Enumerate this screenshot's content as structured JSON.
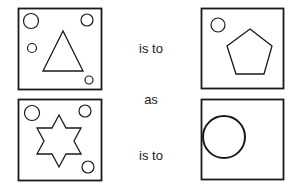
{
  "puzzle": {
    "type": "visual-analogy",
    "connectors": {
      "first": "is to",
      "middle": "as",
      "second": "is to"
    },
    "panels": [
      {
        "id": "A",
        "position": "top-left",
        "main_shape": "triangle",
        "small_circles": 4
      },
      {
        "id": "B",
        "position": "top-right",
        "main_shape": "pentagon",
        "small_circles": 1
      },
      {
        "id": "C",
        "position": "bottom-left",
        "main_shape": "six-pointed-star",
        "small_circles": 3
      },
      {
        "id": "D",
        "position": "bottom-right",
        "main_shape": "circle",
        "small_circles": 0
      }
    ],
    "colors": {
      "stroke": "#1a1a1a",
      "background": "#ffffff",
      "text": "#222222"
    }
  }
}
